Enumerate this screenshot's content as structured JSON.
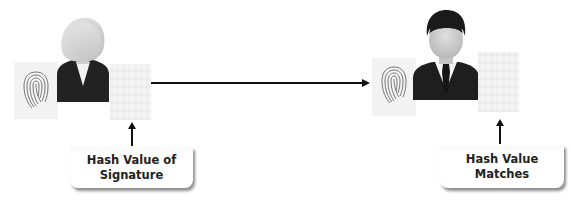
{
  "diagram": {
    "type": "flow",
    "sender": {
      "role": "sender",
      "avatar_icon": "female-user-icon",
      "fingerprint_icon": "fingerprint-icon",
      "hash_panel": "hash-grid-panel",
      "label_line1": "Hash Value of",
      "label_line2": "Signature"
    },
    "receiver": {
      "role": "receiver",
      "avatar_icon": "male-user-icon",
      "fingerprint_icon": "fingerprint-icon",
      "hash_panel": "hash-grid-panel",
      "label_line1": "Hash Value",
      "label_line2": "Matches"
    },
    "connections": [
      {
        "from": "sender",
        "to": "receiver",
        "style": "arrow-right"
      },
      {
        "from": "sender.label",
        "to": "sender.hash_panel",
        "style": "arrow-up"
      },
      {
        "from": "receiver.label",
        "to": "receiver.hash_panel",
        "style": "arrow-up"
      }
    ],
    "colors": {
      "line": "#111111",
      "panel": "#f3f3f3",
      "suit": "#1e1e1e",
      "face": "#d4d4d4"
    }
  }
}
